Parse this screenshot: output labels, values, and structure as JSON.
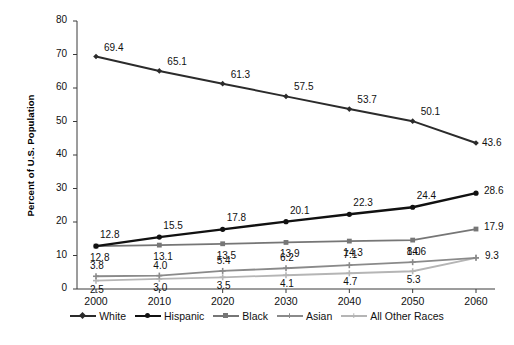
{
  "chart_data": {
    "type": "line",
    "title": "",
    "xlabel": "",
    "ylabel": "Percent of U.S. Population",
    "categories": [
      "2000",
      "2010",
      "2020",
      "2030",
      "2040",
      "2050",
      "2060"
    ],
    "ylim": [
      0,
      80
    ],
    "yticks": [
      "0",
      "10",
      "20",
      "30",
      "40",
      "50",
      "60",
      "70",
      "80"
    ],
    "grid": false,
    "legend_position": "bottom",
    "series": [
      {
        "name": "White",
        "color": "#2b2b2b",
        "marker": "diamond",
        "width": 2.0,
        "values": [
          69.4,
          65.1,
          61.3,
          57.5,
          53.7,
          50.1,
          43.6
        ],
        "labels": [
          "69.4",
          "65.1",
          "61.3",
          "57.5",
          "53.7",
          "50.1",
          "43.6"
        ]
      },
      {
        "name": "Hispanic",
        "color": "#111111",
        "marker": "circle",
        "width": 2.4,
        "values": [
          12.8,
          15.5,
          17.8,
          20.1,
          22.3,
          24.4,
          28.6
        ],
        "labels": [
          "12.8",
          "15.5",
          "17.8",
          "20.1",
          "22.3",
          "24.4",
          "28.6"
        ]
      },
      {
        "name": "Black",
        "color": "#767676",
        "marker": "square",
        "width": 1.8,
        "values": [
          12.8,
          13.1,
          13.5,
          13.9,
          14.3,
          14.6,
          17.9
        ],
        "labels": [
          "12.8",
          "13.1",
          "13.5",
          "13.9",
          "14.3",
          "14.6",
          "17.9"
        ]
      },
      {
        "name": "Asian",
        "color": "#8a8a8a",
        "marker": "plus",
        "width": 1.8,
        "values": [
          3.8,
          4.0,
          5.4,
          6.2,
          7.1,
          8.0,
          9.3
        ],
        "labels": [
          "3.8",
          "4.0",
          "5.4",
          "6.2",
          "7.1",
          "8.0",
          "9.3"
        ]
      },
      {
        "name": "All Other Races",
        "color": "#b5b5b5",
        "marker": "plus",
        "width": 1.8,
        "values": [
          2.5,
          3.0,
          3.5,
          4.1,
          4.7,
          5.3,
          9.3
        ],
        "labels": [
          "2.5",
          "3.0",
          "3.5",
          "4.1",
          "4.7",
          "5.3",
          ""
        ]
      }
    ]
  },
  "axis": {
    "y_title": "Percent of U.S. Population"
  },
  "legend": {
    "items": [
      {
        "label": "White"
      },
      {
        "label": "Hispanic"
      },
      {
        "label": "Black"
      },
      {
        "label": "Asian"
      },
      {
        "label": "All Other Races"
      }
    ]
  }
}
